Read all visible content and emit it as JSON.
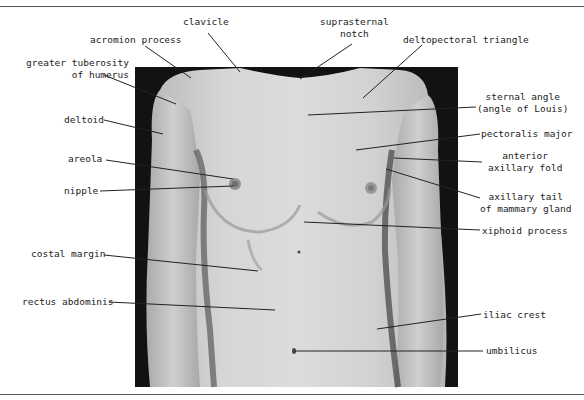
{
  "figure": {
    "colors": {
      "background": "#ffffff",
      "photo_backdrop": "#111111",
      "skin_light": "#d8d8d8",
      "skin_mid": "#bcbcbc",
      "shadow": "#8a8a8a",
      "leader_line": "#222222",
      "rule": "#555555"
    },
    "labels": {
      "clavicle": {
        "lines": [
          "clavicle"
        ]
      },
      "acromion_process": {
        "lines": [
          "acromion process"
        ]
      },
      "greater_tuberosity": {
        "lines": [
          "greater tuberosity",
          "of humerus"
        ]
      },
      "deltoid": {
        "lines": [
          "deltoid"
        ]
      },
      "areola": {
        "lines": [
          "areola"
        ]
      },
      "nipple": {
        "lines": [
          "nipple"
        ]
      },
      "costal_margin": {
        "lines": [
          "costal margin"
        ]
      },
      "rectus_abdominis": {
        "lines": [
          "rectus abdominis"
        ]
      },
      "suprasternal_notch": {
        "lines": [
          "suprasternal",
          "notch"
        ]
      },
      "deltopectoral_triangle": {
        "lines": [
          "deltopectoral triangle"
        ]
      },
      "sternal_angle": {
        "lines": [
          "sternal angle",
          "(angle of Louis)"
        ]
      },
      "pectoralis_major": {
        "lines": [
          "pectoralis major"
        ]
      },
      "anterior_axillary_fold": {
        "lines": [
          "anterior",
          "axillary fold"
        ]
      },
      "axillary_tail": {
        "lines": [
          "axillary tail",
          "of mammary gland"
        ]
      },
      "xiphoid_process": {
        "lines": [
          "xiphoid process"
        ]
      },
      "iliac_crest": {
        "lines": [
          "iliac crest"
        ]
      },
      "umbilicus": {
        "lines": [
          "umbilicus"
        ]
      }
    }
  }
}
